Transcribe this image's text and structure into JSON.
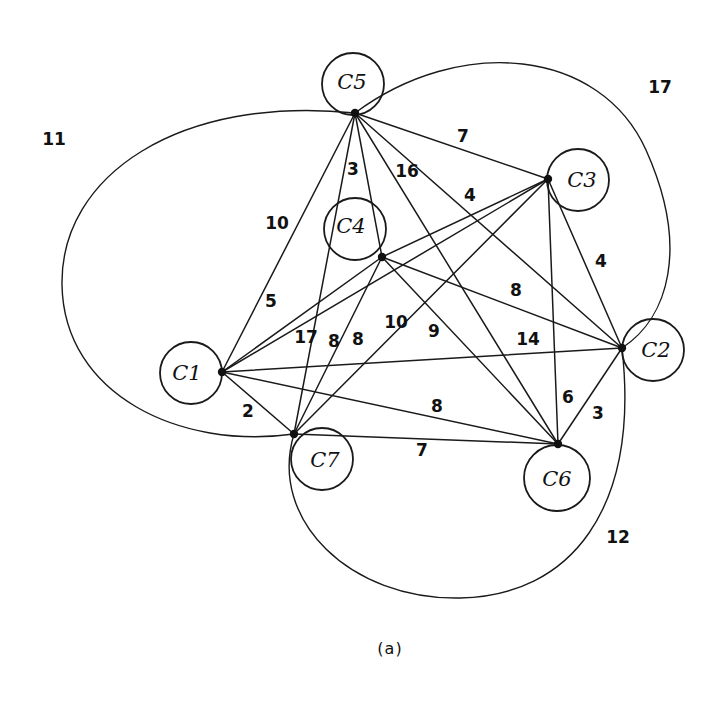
{
  "figure": {
    "caption": "(a)",
    "caption_pos": {
      "x": 390,
      "y": 649
    },
    "stroke_color": "#1a1a1a",
    "background": "#ffffff"
  },
  "nodes": [
    {
      "id": "C1",
      "label": "C1",
      "dot": {
        "x": 222,
        "y": 372
      },
      "circle": {
        "cx": 191,
        "cy": 373,
        "r": 31
      },
      "text": {
        "x": 187,
        "y": 374
      }
    },
    {
      "id": "C2",
      "label": "C2",
      "dot": {
        "x": 622,
        "y": 348
      },
      "circle": {
        "cx": 653,
        "cy": 350,
        "r": 31
      },
      "text": {
        "x": 656,
        "y": 351
      }
    },
    {
      "id": "C3",
      "label": "C3",
      "dot": {
        "x": 548,
        "y": 179
      },
      "circle": {
        "cx": 578,
        "cy": 180,
        "r": 31
      },
      "text": {
        "x": 582,
        "y": 181
      }
    },
    {
      "id": "C4",
      "label": "C4",
      "dot": {
        "x": 382,
        "y": 257
      },
      "circle": {
        "cx": 355,
        "cy": 229,
        "r": 31
      },
      "text": {
        "x": 351,
        "y": 227
      }
    },
    {
      "id": "C5",
      "label": "C5",
      "dot": {
        "x": 355,
        "y": 113
      },
      "circle": {
        "cx": 353,
        "cy": 84,
        "r": 31
      },
      "text": {
        "x": 352,
        "y": 83
      }
    },
    {
      "id": "C6",
      "label": "C6",
      "dot": {
        "x": 558,
        "y": 444
      },
      "circle": {
        "cx": 557,
        "cy": 478,
        "r": 33
      },
      "text": {
        "x": 557,
        "y": 480
      }
    },
    {
      "id": "C7",
      "label": "C7",
      "dot": {
        "x": 294,
        "y": 434
      },
      "circle": {
        "cx": 322,
        "cy": 459,
        "r": 31
      },
      "text": {
        "x": 325,
        "y": 461
      }
    }
  ],
  "edges": [
    {
      "from": "C5",
      "to": "C3",
      "weight": "7",
      "label_pos": {
        "x": 463,
        "y": 137
      }
    },
    {
      "from": "C5",
      "to": "C4",
      "weight": "3",
      "label_pos": {
        "x": 353,
        "y": 170
      }
    },
    {
      "from": "C5",
      "to": "C7",
      "weight": "16",
      "label_pos": {
        "x": 407,
        "y": 172
      }
    },
    {
      "from": "C5",
      "to": "C1",
      "weight": "10",
      "label_pos": {
        "x": 277,
        "y": 224
      }
    },
    {
      "from": "C5",
      "to": "C6",
      "weight": "14",
      "label_pos": {
        "x": 528,
        "y": 340
      }
    },
    {
      "from": "C5",
      "to": "C2",
      "weight": "9",
      "label_pos": {
        "x": 434,
        "y": 332
      }
    },
    {
      "from": "C4",
      "to": "C3",
      "weight": "4",
      "label_pos": {
        "x": 470,
        "y": 196
      }
    },
    {
      "from": "C4",
      "to": "C1",
      "weight": "5",
      "label_pos": {
        "x": 271,
        "y": 302
      }
    },
    {
      "from": "C4",
      "to": "C2",
      "weight": "8",
      "label_pos": {
        "x": 516,
        "y": 291
      }
    },
    {
      "from": "C4",
      "to": "C7",
      "weight": "8",
      "label_pos": {
        "x": 358,
        "y": 340
      }
    },
    {
      "from": "C4",
      "to": "C6",
      "weight": "10",
      "label_pos": {
        "x": 396,
        "y": 323
      }
    },
    {
      "from": "C3",
      "to": "C2",
      "weight": "4",
      "label_pos": {
        "x": 601,
        "y": 262
      }
    },
    {
      "from": "C3",
      "to": "C1",
      "weight": "17",
      "label_pos": {
        "x": 306,
        "y": 338
      }
    },
    {
      "from": "C3",
      "to": "C7",
      "weight": "8",
      "label_pos": {
        "x": 334,
        "y": 342
      }
    },
    {
      "from": "C3",
      "to": "C6",
      "weight": "6",
      "label_pos": {
        "x": 568,
        "y": 398
      }
    },
    {
      "from": "C1",
      "to": "C2",
      "weight": "",
      "label_pos": {
        "x": 0,
        "y": 0
      }
    },
    {
      "from": "C1",
      "to": "C6",
      "weight": "8",
      "label_pos": {
        "x": 437,
        "y": 407
      }
    },
    {
      "from": "C1",
      "to": "C7",
      "weight": "2",
      "label_pos": {
        "x": 248,
        "y": 412
      }
    },
    {
      "from": "C7",
      "to": "C6",
      "weight": "7",
      "label_pos": {
        "x": 422,
        "y": 451
      }
    },
    {
      "from": "C6",
      "to": "C2",
      "weight": "3",
      "label_pos": {
        "x": 598,
        "y": 414
      }
    }
  ],
  "arcs": [
    {
      "id": "arc-11",
      "from": "C5",
      "to": "C7",
      "weight": "11",
      "label_pos": {
        "x": 54,
        "y": 140
      },
      "path": "M 355 113 C 180 95, 60 175, 62 285 C 64 395, 180 450, 294 434"
    },
    {
      "id": "arc-17",
      "from": "C5",
      "to": "C2",
      "weight": "17",
      "label_pos": {
        "x": 660,
        "y": 88
      },
      "path": "M 355 113 C 460 35, 600 48, 646 150 C 690 248, 668 318, 622 348"
    },
    {
      "id": "arc-12",
      "from": "C7",
      "to": "C2",
      "weight": "12",
      "label_pos": {
        "x": 618,
        "y": 538
      },
      "path": "M 294 434 C 268 520, 350 600, 460 598 C 570 596, 640 510, 622 348"
    }
  ],
  "chart_data": {
    "type": "diagram",
    "title": "(a)",
    "vertices": [
      "C1",
      "C2",
      "C3",
      "C4",
      "C5",
      "C6",
      "C7"
    ],
    "edge_weights": [
      {
        "edge": "C5-C3",
        "weight": 7
      },
      {
        "edge": "C5-C4",
        "weight": 3
      },
      {
        "edge": "C5-C7",
        "weight": 16
      },
      {
        "edge": "C5-C1",
        "weight": 10
      },
      {
        "edge": "C5-C6",
        "weight": 14
      },
      {
        "edge": "C5-C2",
        "weight": 9
      },
      {
        "edge": "C4-C3",
        "weight": 4
      },
      {
        "edge": "C4-C1",
        "weight": 5
      },
      {
        "edge": "C4-C2",
        "weight": 8
      },
      {
        "edge": "C4-C7",
        "weight": 8
      },
      {
        "edge": "C4-C6",
        "weight": 10
      },
      {
        "edge": "C3-C2",
        "weight": 4
      },
      {
        "edge": "C3-C1",
        "weight": 17
      },
      {
        "edge": "C3-C7",
        "weight": 8
      },
      {
        "edge": "C3-C6",
        "weight": 6
      },
      {
        "edge": "C1-C6",
        "weight": 8
      },
      {
        "edge": "C1-C7",
        "weight": 2
      },
      {
        "edge": "C7-C6",
        "weight": 7
      },
      {
        "edge": "C6-C2",
        "weight": 3
      },
      {
        "edge": "C5-C7 (arc)",
        "weight": 11
      },
      {
        "edge": "C5-C2 (arc)",
        "weight": 17
      },
      {
        "edge": "C7-C2 (arc)",
        "weight": 12
      }
    ]
  }
}
